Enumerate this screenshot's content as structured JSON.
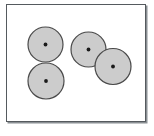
{
  "figure": {
    "title": "",
    "caption": "",
    "background_color": "#ffffff",
    "frame": {
      "border_color": "#555a5e",
      "shadow_color": "#8a8f93",
      "fill_color": "#ffffff"
    },
    "style": {
      "circle_fill": "#cccccc",
      "circle_stroke": "#4a4a4a",
      "center_dot_color": "#1a1a1a",
      "stroke_width": 1.2,
      "center_dot_radius": 1.9
    },
    "groups": [
      {
        "name": "left-vertical-pair",
        "label": "",
        "circles": [
          {
            "name": "circle-top-left-group",
            "cx": 45.5,
            "cy": 44.5,
            "r": 17.5
          },
          {
            "name": "circle-bottom-left-group",
            "cx": 46.0,
            "cy": 81.0,
            "r": 18.0
          }
        ]
      },
      {
        "name": "right-diagonal-pair",
        "label": "",
        "circles": [
          {
            "name": "circle-upper-right-group",
            "cx": 88.5,
            "cy": 49.5,
            "r": 17.5
          },
          {
            "name": "circle-lower-right-group",
            "cx": 113.0,
            "cy": 66.5,
            "r": 18.0
          }
        ]
      }
    ]
  }
}
